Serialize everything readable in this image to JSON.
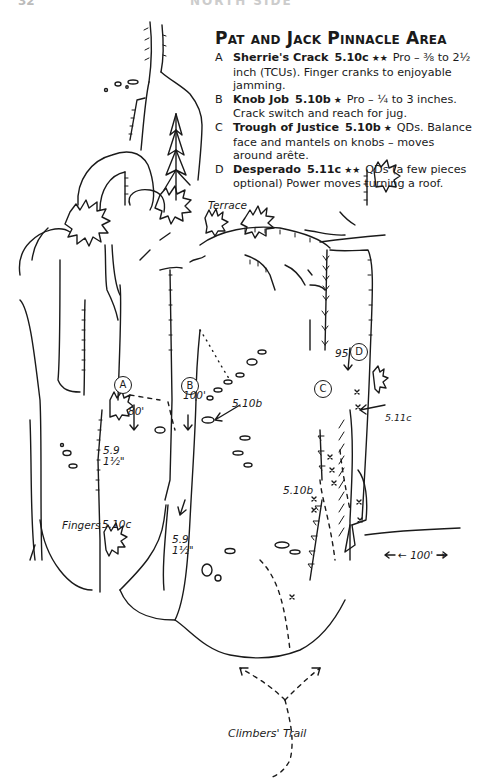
{
  "page": {
    "number": "32",
    "running_head": "NORTH SIDE"
  },
  "legend": {
    "title": "Pat and Jack Pinnacle Area",
    "routes": [
      {
        "letter": "A",
        "name": "Sherrie's Crack",
        "grade": "5.10c",
        "stars": "★★",
        "description": "Pro – ⅜ to 2½ inch (TCUs). Finger cranks to enjoyable jamming."
      },
      {
        "letter": "B",
        "name": "Knob Job",
        "grade": "5.10b",
        "stars": "★",
        "description": "Pro – ¼ to 3 inches. Crack switch and reach for jug."
      },
      {
        "letter": "C",
        "name": "Trough of Justice",
        "grade": "5.10b",
        "stars": "★",
        "description": "QDs. Balance face and mantels on knobs – moves around arête."
      },
      {
        "letter": "D",
        "name": "Desperado",
        "grade": "5.11c",
        "stars": "★★",
        "description": "QDs (a few pieces optional) Power moves turning a roof."
      }
    ]
  },
  "topo": {
    "labels": {
      "terrace": "Terrace",
      "route_a": "A",
      "route_b": "B",
      "route_c": "C",
      "route_d": "D",
      "len_a": "80'",
      "len_b": "100'",
      "len_d": "95'",
      "grade_b_var": "5.10b",
      "grade_d_var": "5.11c",
      "grade_c_var": "5.10b",
      "grade_left_crack": "5.9",
      "size_left_crack": "1½\"",
      "grade_center_crack": "5.9",
      "size_center_crack": "1½\"",
      "fingers": "Fingers",
      "grade_fingers": "5.10c",
      "distance": "← 100' →",
      "trail": "Climbers' Trail"
    }
  }
}
